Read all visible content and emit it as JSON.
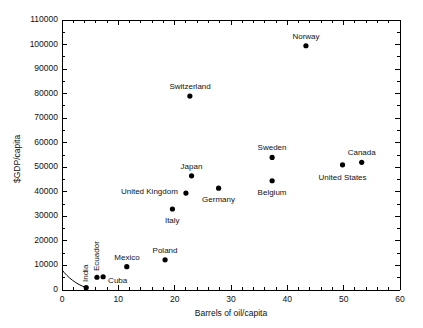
{
  "chart_data": {
    "type": "scatter",
    "title": "",
    "xlabel": "Barrels of oil/capita",
    "ylabel": "$GDP/capita",
    "xlim": [
      0,
      60
    ],
    "ylim": [
      0,
      110000
    ],
    "x_major_step": 10,
    "x_minor_step": 2,
    "y_major_step": 10000,
    "y_minor_step": 5000,
    "grid": false,
    "legend": false,
    "marker_color": "#000000",
    "axis_color": "#000000",
    "xticks": [
      "0",
      "10",
      "20",
      "30",
      "40",
      "50",
      "60"
    ],
    "yticks": [
      "0",
      "10000",
      "20000",
      "30000",
      "40000",
      "50000",
      "60000",
      "70000",
      "80000",
      "90000",
      "100000",
      "110000"
    ],
    "points": [
      {
        "label": "India",
        "x": 4.3,
        "y": 1000,
        "lx": -5,
        "ly": -6,
        "rot": true,
        "anchor": "end"
      },
      {
        "label": "Ecuador",
        "x": 6.2,
        "y": 5200,
        "lx": -5,
        "ly": -6,
        "rot": true,
        "anchor": "end"
      },
      {
        "label": "Cuba",
        "x": 7.3,
        "y": 5400,
        "lx": 5,
        "ly": 4,
        "rot": false,
        "anchor": "start"
      },
      {
        "label": "Mexico",
        "x": 11.5,
        "y": 9500,
        "lx": 0,
        "ly": -9,
        "rot": false,
        "anchor": "middle"
      },
      {
        "label": "Poland",
        "x": 18.3,
        "y": 12300,
        "lx": 0,
        "ly": -9,
        "rot": false,
        "anchor": "middle"
      },
      {
        "label": "Italy",
        "x": 19.6,
        "y": 33000,
        "lx": 0,
        "ly": 12,
        "rot": false,
        "anchor": "middle"
      },
      {
        "label": "United Kingdom",
        "x": 22.0,
        "y": 39500,
        "lx": -8,
        "ly": -1,
        "rot": false,
        "anchor": "end"
      },
      {
        "label": "Japan",
        "x": 23.0,
        "y": 46500,
        "lx": 0,
        "ly": -9,
        "rot": false,
        "anchor": "middle"
      },
      {
        "label": "Switzerland",
        "x": 22.7,
        "y": 79000,
        "lx": 0,
        "ly": -9,
        "rot": false,
        "anchor": "middle"
      },
      {
        "label": "Germany",
        "x": 27.8,
        "y": 41500,
        "lx": 0,
        "ly": 12,
        "rot": false,
        "anchor": "middle"
      },
      {
        "label": "Belgium",
        "x": 37.3,
        "y": 44500,
        "lx": 0,
        "ly": 12,
        "rot": false,
        "anchor": "middle"
      },
      {
        "label": "Sweden",
        "x": 37.3,
        "y": 54000,
        "lx": 0,
        "ly": -9,
        "rot": false,
        "anchor": "middle"
      },
      {
        "label": "Norway",
        "x": 43.3,
        "y": 99500,
        "lx": 0,
        "ly": -9,
        "rot": false,
        "anchor": "middle"
      },
      {
        "label": "United States",
        "x": 49.8,
        "y": 51000,
        "lx": 0,
        "ly": 13,
        "rot": false,
        "anchor": "middle"
      },
      {
        "label": "Canada",
        "x": 53.2,
        "y": 52000,
        "lx": 0,
        "ly": -9,
        "rot": false,
        "anchor": "middle"
      }
    ],
    "annotations": [
      {
        "name": "origin-curve",
        "description": "curved arc from y-axis near 8000 down to the India point"
      }
    ]
  },
  "caption": {
    "text": ""
  }
}
